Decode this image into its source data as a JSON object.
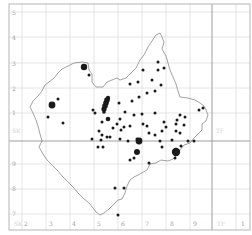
{
  "map": {
    "title": "",
    "frame": {
      "left": 9,
      "top": 4,
      "right": 250,
      "bottom": 230
    },
    "colors": {
      "grid": "#dddddd",
      "grid_major": "#9e9e9e",
      "frame": "#b5b5b5",
      "outline": "#7a7a7a",
      "dot": "#1a1a1a",
      "label": "#9a9a9a"
    },
    "x_axis": {
      "y": 226,
      "labels": [
        {
          "text": "2",
          "x": 24
        },
        {
          "text": "3",
          "x": 49
        },
        {
          "text": "4",
          "x": 72
        },
        {
          "text": "5",
          "x": 97
        },
        {
          "text": "6",
          "x": 121
        },
        {
          "text": "7",
          "x": 145
        },
        {
          "text": "8",
          "x": 170
        },
        {
          "text": "9",
          "x": 193
        },
        {
          "text": "1",
          "x": 241
        }
      ],
      "faint_labels": [
        {
          "text": "SK",
          "x": 14
        },
        {
          "text": "TF",
          "x": 217
        }
      ],
      "gridlines_x": [
        22,
        46,
        70,
        94,
        118,
        142,
        166,
        190,
        236
      ]
    },
    "y_axis": {
      "x": 12,
      "labels": [
        {
          "text": "5",
          "y": 15
        },
        {
          "text": "4",
          "y": 40
        },
        {
          "text": "3",
          "y": 66
        },
        {
          "text": "2",
          "y": 91
        },
        {
          "text": "1",
          "y": 115
        },
        {
          "text": "9",
          "y": 166
        },
        {
          "text": "8",
          "y": 191
        },
        {
          "text": "7",
          "y": 216
        }
      ],
      "faint_labels": [
        {
          "text": "SK",
          "y": 133
        },
        {
          "text": "TF",
          "y": 133
        }
      ],
      "gridlines_y": [
        12,
        37,
        63,
        88,
        113,
        164,
        189,
        214
      ]
    },
    "major_lines": {
      "horizontal_y": 141,
      "vertical_x": 212
    },
    "outline_points": "82,62 88,63 89,70 92,74 92,82 96,87 103,87 107,82 112,80 117,78 120,80 126,78 131,73 136,68 140,60 144,55 148,47 152,41 156,35 160,33 162,37 164,42 162,49 166,56 168,63 170,70 173,77 176,84 178,91 180,97 188,98 195,100 200,103 204,106 206,110 208,115 206,121 202,124 202,130 198,134 194,138 190,143 184,145 180,150 177,155 173,159 168,161 161,160 156,163 150,164 147,170 140,174 134,177 130,180 127,186 125,193 122,199 118,200 114,204 109,209 104,213 100,215 96,212 93,208 89,203 84,199 78,193 73,187 68,182 63,177 58,171 52,165 47,160 43,154 39,147 42,141 40,134 38,126 36,120 33,113 30,107 33,101 38,96 42,91 45,85 49,82 54,78 58,73 62,69 68,66 74,63 82,62",
    "dots": [
      {
        "x": 84,
        "y": 67,
        "r": 3.2
      },
      {
        "x": 89,
        "y": 75,
        "r": 1.5
      },
      {
        "x": 52,
        "y": 105,
        "r": 3.4
      },
      {
        "x": 58,
        "y": 99,
        "r": 1.5
      },
      {
        "x": 48,
        "y": 117,
        "r": 1.5
      },
      {
        "x": 63,
        "y": 123,
        "r": 1.5
      },
      {
        "x": 107,
        "y": 100,
        "r": 2.8
      },
      {
        "x": 106,
        "y": 103,
        "r": 2.8
      },
      {
        "x": 105,
        "y": 106,
        "r": 2.8
      },
      {
        "x": 104,
        "y": 109,
        "r": 2.6
      },
      {
        "x": 104,
        "y": 112,
        "r": 1.8
      },
      {
        "x": 108,
        "y": 98,
        "r": 2.2
      },
      {
        "x": 93,
        "y": 110,
        "r": 1.5
      },
      {
        "x": 95,
        "y": 113,
        "r": 1.5
      },
      {
        "x": 108,
        "y": 119,
        "r": 2.3
      },
      {
        "x": 119,
        "y": 103,
        "r": 1.5
      },
      {
        "x": 125,
        "y": 112,
        "r": 1.5
      },
      {
        "x": 130,
        "y": 84,
        "r": 1.5
      },
      {
        "x": 143,
        "y": 70,
        "r": 1.5
      },
      {
        "x": 158,
        "y": 62,
        "r": 1.5
      },
      {
        "x": 158,
        "y": 70,
        "r": 1.5
      },
      {
        "x": 164,
        "y": 68,
        "r": 1.5
      },
      {
        "x": 138,
        "y": 82,
        "r": 1.5
      },
      {
        "x": 147,
        "y": 93,
        "r": 1.5
      },
      {
        "x": 155,
        "y": 91,
        "r": 1.5
      },
      {
        "x": 152,
        "y": 80,
        "r": 1.5
      },
      {
        "x": 161,
        "y": 85,
        "r": 1.5
      },
      {
        "x": 132,
        "y": 101,
        "r": 1.5
      },
      {
        "x": 139,
        "y": 97,
        "r": 1.5
      },
      {
        "x": 134,
        "y": 115,
        "r": 1.5
      },
      {
        "x": 142,
        "y": 114,
        "r": 1.5
      },
      {
        "x": 120,
        "y": 119,
        "r": 1.5
      },
      {
        "x": 117,
        "y": 124,
        "r": 1.5
      },
      {
        "x": 113,
        "y": 128,
        "r": 1.5
      },
      {
        "x": 121,
        "y": 130,
        "r": 1.5
      },
      {
        "x": 124,
        "y": 127,
        "r": 1.5
      },
      {
        "x": 130,
        "y": 126,
        "r": 1.5
      },
      {
        "x": 102,
        "y": 122,
        "r": 1.5
      },
      {
        "x": 99,
        "y": 131,
        "r": 1.5
      },
      {
        "x": 102,
        "y": 135,
        "r": 1.5
      },
      {
        "x": 107,
        "y": 137,
        "r": 1.5
      },
      {
        "x": 98,
        "y": 147,
        "r": 1.5
      },
      {
        "x": 103,
        "y": 147,
        "r": 1.5
      },
      {
        "x": 101,
        "y": 140,
        "r": 1.5
      },
      {
        "x": 110,
        "y": 137,
        "r": 1.5
      },
      {
        "x": 120,
        "y": 139,
        "r": 1.5
      },
      {
        "x": 128,
        "y": 141,
        "r": 1.5
      },
      {
        "x": 137,
        "y": 139,
        "r": 1.5
      },
      {
        "x": 139,
        "y": 141,
        "r": 3.4
      },
      {
        "x": 137,
        "y": 152,
        "r": 3.0
      },
      {
        "x": 130,
        "y": 160,
        "r": 1.5
      },
      {
        "x": 134,
        "y": 158,
        "r": 1.5
      },
      {
        "x": 149,
        "y": 133,
        "r": 1.5
      },
      {
        "x": 155,
        "y": 135,
        "r": 1.5
      },
      {
        "x": 160,
        "y": 141,
        "r": 1.5
      },
      {
        "x": 162,
        "y": 131,
        "r": 1.5
      },
      {
        "x": 166,
        "y": 127,
        "r": 1.5
      },
      {
        "x": 164,
        "y": 122,
        "r": 1.5
      },
      {
        "x": 162,
        "y": 147,
        "r": 1.5
      },
      {
        "x": 176,
        "y": 152,
        "r": 4.2
      },
      {
        "x": 175,
        "y": 158,
        "r": 1.5
      },
      {
        "x": 172,
        "y": 140,
        "r": 1.5
      },
      {
        "x": 176,
        "y": 131,
        "r": 1.5
      },
      {
        "x": 177,
        "y": 120,
        "r": 1.5
      },
      {
        "x": 176,
        "y": 124,
        "r": 1.5
      },
      {
        "x": 180,
        "y": 133,
        "r": 1.5
      },
      {
        "x": 181,
        "y": 146,
        "r": 1.5
      },
      {
        "x": 188,
        "y": 141,
        "r": 1.5
      },
      {
        "x": 194,
        "y": 141,
        "r": 1.5
      },
      {
        "x": 184,
        "y": 125,
        "r": 1.5
      },
      {
        "x": 180,
        "y": 115,
        "r": 1.5
      },
      {
        "x": 185,
        "y": 117,
        "r": 1.5
      },
      {
        "x": 199,
        "y": 110,
        "r": 1.5
      },
      {
        "x": 203,
        "y": 108,
        "r": 1.5
      },
      {
        "x": 149,
        "y": 163,
        "r": 1.5
      },
      {
        "x": 115,
        "y": 188,
        "r": 1.5
      },
      {
        "x": 124,
        "y": 188,
        "r": 1.5
      },
      {
        "x": 147,
        "y": 126,
        "r": 1.5
      },
      {
        "x": 143,
        "y": 124,
        "r": 1.5
      },
      {
        "x": 155,
        "y": 113,
        "r": 1.5
      },
      {
        "x": 118,
        "y": 215,
        "r": 1.5
      },
      {
        "x": 92,
        "y": 139,
        "r": 1.5
      }
    ]
  }
}
